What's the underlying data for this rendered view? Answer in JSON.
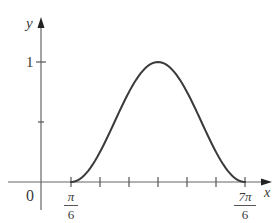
{
  "chart_data": {
    "type": "line",
    "title": "",
    "xlabel": "x",
    "ylabel": "y",
    "x_ticks": [
      {
        "value": "π/6",
        "label_num": "π",
        "label_den": "6"
      },
      {
        "value": "π/3",
        "label_num": "",
        "label_den": ""
      },
      {
        "value": "π/2",
        "label_num": "",
        "label_den": ""
      },
      {
        "value": "2π/3",
        "label_num": "",
        "label_den": ""
      },
      {
        "value": "5π/6",
        "label_num": "",
        "label_den": ""
      },
      {
        "value": "π",
        "label_num": "",
        "label_den": ""
      },
      {
        "value": "7π/6",
        "label_num": "7π",
        "label_den": "6"
      }
    ],
    "y_ticks": [
      {
        "value": 0.5,
        "label": ""
      },
      {
        "value": 1,
        "label": "1"
      }
    ],
    "origin_label": "0",
    "xlim": [
      0,
      3.8
    ],
    "ylim": [
      0,
      1.25
    ],
    "series": [
      {
        "name": "curve",
        "description": "smooth bump, zero at x=π/6 and x=7π/6, maximum 1 at x=2π/3",
        "x": [
          0.5236,
          0.6981,
          0.8727,
          1.0472,
          1.2217,
          1.3963,
          1.5708,
          1.7453,
          1.9199,
          2.0944,
          2.2689,
          2.4435,
          2.618,
          2.7925,
          2.9671,
          3.1416,
          3.3161,
          3.4907,
          3.6652
        ],
        "y": [
          0.0,
          0.03,
          0.117,
          0.25,
          0.413,
          0.587,
          0.75,
          0.883,
          0.97,
          1.0,
          0.97,
          0.883,
          0.75,
          0.587,
          0.413,
          0.25,
          0.117,
          0.03,
          0.0
        ]
      }
    ],
    "grid": false,
    "legend": null
  },
  "axes": {
    "x_label": "x",
    "y_label": "y",
    "origin": "0",
    "y_one": "1",
    "pi6_num": "π",
    "pi6_den": "6",
    "sevenpi6_num": "7π",
    "sevenpi6_den": "6"
  },
  "colors": {
    "axis": "#555555",
    "curve": "#3a3a3a",
    "text": "#3a3a3a"
  }
}
